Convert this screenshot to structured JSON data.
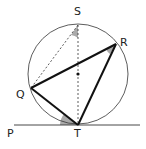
{
  "diagram": {
    "type": "circle-geometry",
    "points": {
      "S": {
        "label": "S",
        "x": 78,
        "y": 25
      },
      "R": {
        "label": "R",
        "x": 116,
        "y": 44
      },
      "Q": {
        "label": "Q",
        "x": 31,
        "y": 88
      },
      "T": {
        "label": "T",
        "x": 78,
        "y": 124
      },
      "P": {
        "label": "P",
        "x": 10,
        "y": 125
      }
    },
    "circle": {
      "cx": 78,
      "cy": 74,
      "r": 50
    },
    "segments": [
      {
        "from": "Q",
        "to": "R",
        "style": "bold"
      },
      {
        "from": "R",
        "to": "T",
        "style": "bold"
      },
      {
        "from": "Q",
        "to": "T",
        "style": "bold"
      },
      {
        "from": "S",
        "to": "Q",
        "style": "dashed"
      },
      {
        "from": "S",
        "to": "T",
        "style": "dashed"
      }
    ],
    "tangent": {
      "label": "P",
      "through": "T"
    },
    "marked_angles": [
      "QST",
      "QRT",
      "PTQ"
    ],
    "colors": {
      "line": "#222222",
      "angle_fill": "#aaaaaa"
    }
  }
}
